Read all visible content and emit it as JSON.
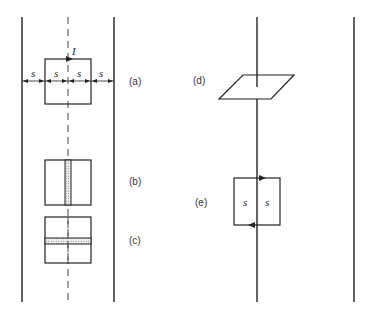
{
  "figure": {
    "panels": [
      {
        "id": "a",
        "label": "(a)",
        "description": "square loop carrying current I centered on dashed symmetry line between two parallel wires, spacings s"
      },
      {
        "id": "b",
        "label": "(b)",
        "description": "square loop with shaded vertical strip along centerline"
      },
      {
        "id": "c",
        "label": "(c)",
        "description": "square loop with shaded horizontal strip"
      },
      {
        "id": "d",
        "label": "(d)",
        "description": "parallelogram loop pierced by vertical wire"
      },
      {
        "id": "e",
        "label": "(e)",
        "description": "square loop straddling wire with half-widths s"
      }
    ],
    "current_symbol": "I",
    "spacing_symbol": "s",
    "dimension_labels_a": [
      "s",
      "s",
      "s",
      "s"
    ],
    "dimension_labels_e": [
      "s",
      "s"
    ]
  }
}
